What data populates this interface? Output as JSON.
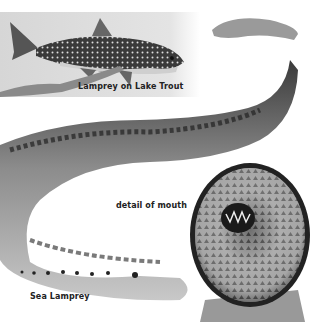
{
  "illustration": {
    "subjects": [
      "lake trout with attached lamprey",
      "sea lamprey body",
      "lamprey oral disc"
    ],
    "labels": {
      "trout": "Lamprey on Lake Trout",
      "mouth": "detail of mouth",
      "sea": "Sea Lamprey"
    },
    "colors": {
      "background": "#ffffff",
      "trout_panel": "#d8d8d8",
      "lamprey_body": "#8a8a8a",
      "lamprey_dark": "#2a2a2a",
      "label_text": "#222222"
    }
  }
}
